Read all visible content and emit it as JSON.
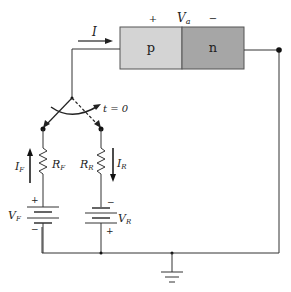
{
  "diagram": {
    "diode": {
      "p_label": "p",
      "n_label": "n",
      "voltage_label": "V",
      "voltage_sub": "a",
      "plus": "+",
      "minus": "−",
      "p_color": "#d4d4d4",
      "n_color": "#a6a6a6"
    },
    "current": {
      "label": "I"
    },
    "switch": {
      "label": "t = 0"
    },
    "forward_branch": {
      "current_label": "I",
      "current_sub": "F",
      "resistor_label": "R",
      "resistor_sub": "F",
      "source_label": "V",
      "source_sub": "F",
      "plus": "+",
      "minus": "−"
    },
    "reverse_branch": {
      "current_label": "I",
      "current_sub": "R",
      "resistor_label": "R",
      "resistor_sub": "R",
      "source_label": "V",
      "source_sub": "R",
      "plus": "+",
      "minus": "−"
    }
  }
}
